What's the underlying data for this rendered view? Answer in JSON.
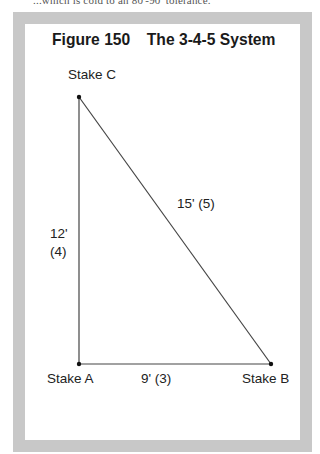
{
  "header_fragment": "...which is cold to an 80'-90' tolerance.",
  "figure": {
    "number": "Figure 150",
    "title": "The 3-4-5 System"
  },
  "points": {
    "a": {
      "label": "Stake A",
      "x": 79,
      "y": 364
    },
    "b": {
      "label": "Stake B",
      "x": 271,
      "y": 364
    },
    "c": {
      "label": "Stake C",
      "x": 79,
      "y": 97
    }
  },
  "sides": {
    "ac": {
      "length": "12'",
      "ratio": "(4)"
    },
    "ab": {
      "label": "9' (3)"
    },
    "bc": {
      "label": "15' (5)"
    }
  },
  "colors": {
    "frame": "#c8c8c8",
    "line": "#333333",
    "text": "#222222"
  }
}
